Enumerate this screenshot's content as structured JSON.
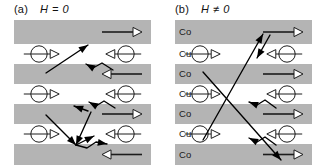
{
  "figure": {
    "type": "schematic-diagram",
    "background_color": "#ffffff",
    "magnetic_layer_color": "#b4b4b4",
    "spacer_layer_color": "#ffffff",
    "ink_color": "#1c1c1c"
  },
  "panels": [
    {
      "id": "a",
      "tag": "(a)",
      "condition": "H = 0",
      "state": "antiparallel",
      "show_layer_labels": false,
      "layers": [
        {
          "material": "Co",
          "kind": "mag",
          "magnetization": "right",
          "label": ""
        },
        {
          "material": "Cu",
          "kind": "spacer",
          "magnetization": "none",
          "label": ""
        },
        {
          "material": "Co",
          "kind": "mag",
          "magnetization": "left",
          "label": ""
        },
        {
          "material": "Cu",
          "kind": "spacer",
          "magnetization": "none",
          "label": ""
        },
        {
          "material": "Co",
          "kind": "mag",
          "magnetization": "right",
          "label": ""
        },
        {
          "material": "Cu",
          "kind": "spacer",
          "magnetization": "none",
          "label": ""
        },
        {
          "material": "Co",
          "kind": "mag",
          "magnetization": "left",
          "label": ""
        }
      ],
      "spins": [
        {
          "layer_index": 1,
          "side": "left",
          "arrow": "right"
        },
        {
          "layer_index": 1,
          "side": "right",
          "arrow": "left"
        },
        {
          "layer_index": 3,
          "side": "left",
          "arrow": "right"
        },
        {
          "layer_index": 3,
          "side": "right",
          "arrow": "left"
        },
        {
          "layer_index": 5,
          "side": "left",
          "arrow": "right"
        },
        {
          "layer_index": 5,
          "side": "right",
          "arrow": "left"
        }
      ],
      "trajectories": [
        {
          "kind": "scattered",
          "points": [
            [
              32,
              53
            ],
            [
              74,
              25
            ]
          ]
        },
        {
          "kind": "scattered",
          "points": [
            [
              99,
              50
            ],
            [
              88,
              43
            ],
            [
              79,
              48
            ],
            [
              72,
              44
            ]
          ]
        },
        {
          "kind": "scattered",
          "points": [
            [
              74,
              91
            ],
            [
              60,
              86
            ]
          ]
        },
        {
          "kind": "scattered",
          "points": [
            [
              101,
              88
            ],
            [
              90,
              81
            ],
            [
              82,
              86
            ],
            [
              75,
              82
            ]
          ]
        },
        {
          "kind": "scattered",
          "points": [
            [
              77,
              92
            ],
            [
              62,
              125
            ]
          ]
        },
        {
          "kind": "scattered",
          "points": [
            [
              32,
              95
            ],
            [
              62,
              125
            ]
          ]
        },
        {
          "kind": "scattered",
          "points": [
            [
              62,
              125
            ],
            [
              80,
              116
            ]
          ]
        },
        {
          "kind": "scattered",
          "points": [
            [
              62,
              125
            ],
            [
              73,
              128
            ],
            [
              82,
              122
            ],
            [
              93,
              124
            ]
          ]
        }
      ]
    },
    {
      "id": "b",
      "tag": "(b)",
      "condition": "H ≠ 0",
      "state": "parallel",
      "show_layer_labels": true,
      "layers": [
        {
          "material": "Co",
          "kind": "mag",
          "magnetization": "right",
          "label": "Co"
        },
        {
          "material": "Cu",
          "kind": "spacer",
          "magnetization": "none",
          "label": "Cu"
        },
        {
          "material": "Co",
          "kind": "mag",
          "magnetization": "right",
          "label": "Co"
        },
        {
          "material": "Cu",
          "kind": "spacer",
          "magnetization": "none",
          "label": "Cu"
        },
        {
          "material": "Co",
          "kind": "mag",
          "magnetization": "right",
          "label": "Co"
        },
        {
          "material": "Cu",
          "kind": "spacer",
          "magnetization": "none",
          "label": "Cu"
        },
        {
          "material": "Co",
          "kind": "mag",
          "magnetization": "right",
          "label": "Co"
        }
      ],
      "spins": [
        {
          "layer_index": 1,
          "side": "left",
          "arrow": "right"
        },
        {
          "layer_index": 1,
          "side": "right",
          "arrow": "left"
        },
        {
          "layer_index": 3,
          "side": "left",
          "arrow": "right"
        },
        {
          "layer_index": 3,
          "side": "right",
          "arrow": "left"
        },
        {
          "layer_index": 5,
          "side": "left",
          "arrow": "right"
        },
        {
          "layer_index": 5,
          "side": "right",
          "arrow": "left"
        }
      ],
      "trajectories": [
        {
          "kind": "ballistic",
          "points": [
            [
              28,
              120
            ],
            [
              88,
              14
            ]
          ]
        },
        {
          "kind": "ballistic",
          "points": [
            [
              28,
              52
            ],
            [
              106,
              140
            ]
          ]
        },
        {
          "kind": "scattered",
          "points": [
            [
              95,
              15
            ],
            [
              82,
              38
            ]
          ]
        },
        {
          "kind": "scattered",
          "points": [
            [
              101,
              88
            ],
            [
              90,
              80
            ],
            [
              82,
              85
            ],
            [
              74,
              82
            ]
          ]
        },
        {
          "kind": "scattered",
          "points": [
            [
              101,
              125
            ],
            [
              90,
              117
            ],
            [
              82,
              122
            ],
            [
              74,
              118
            ]
          ]
        }
      ]
    }
  ]
}
